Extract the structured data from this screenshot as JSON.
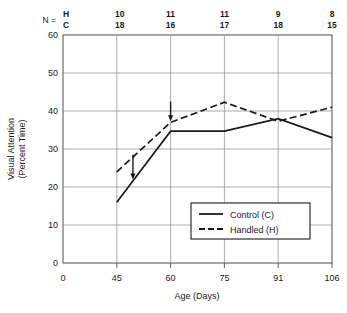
{
  "chart_data": {
    "type": "line",
    "title": "",
    "xlabel": "Age (Days)",
    "ylabel": "Visual Attention\n(Percent Time)",
    "ylabel_line1": "Visual Attention",
    "ylabel_line2": "(Percent Time)",
    "x": [
      45,
      60,
      75,
      91,
      106
    ],
    "xtick_labels": [
      "0",
      "45",
      "60",
      "75",
      "91",
      "106"
    ],
    "ytick_labels": [
      "0",
      "10",
      "20",
      "30",
      "40",
      "50",
      "60"
    ],
    "ylim": [
      0,
      60
    ],
    "grid": true,
    "legend_position": "lower-right",
    "series": [
      {
        "name": "Control   (C)",
        "key": "C",
        "style": "solid",
        "values": [
          16,
          34.7,
          34.7,
          38,
          33
        ]
      },
      {
        "name": "Handled   (H)",
        "key": "H",
        "style": "dashed",
        "values": [
          24,
          37,
          42.3,
          37.3,
          41
        ]
      }
    ],
    "annotations": [
      {
        "name": "arrow-1",
        "x": 49.5,
        "y_from": 28.5,
        "y_to": 22.5
      },
      {
        "name": "arrow-2",
        "x": 60,
        "y_from": 42.5,
        "y_to": 37.8
      }
    ],
    "sample_sizes": {
      "prefix": "N =",
      "row_labels": [
        "H",
        "C"
      ],
      "H": [
        10,
        11,
        11,
        9,
        8
      ],
      "C": [
        18,
        16,
        17,
        18,
        15
      ]
    }
  },
  "colors": {
    "ink": "#1a1a1a",
    "grid": "#8a8a8a",
    "axis": "#4d4d4d",
    "background": "#ffffff"
  }
}
